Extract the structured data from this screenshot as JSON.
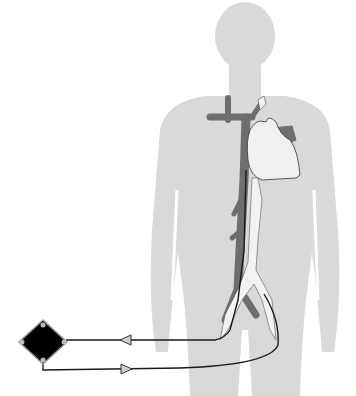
{
  "diagram": {
    "type": "medical-illustration",
    "colors": {
      "body": "#d9d9d9",
      "vein": "#6e6e6e",
      "artery": "#f2f2f2",
      "heart": "#f0f0f0",
      "cannula": "#1a1a1a",
      "device": "#000000",
      "device_border": "#9a9a9a",
      "arrow_fill": "#cfcfcf"
    },
    "elements": [
      {
        "name": "body-silhouette"
      },
      {
        "name": "heart"
      },
      {
        "name": "vena-cava"
      },
      {
        "name": "aorta"
      },
      {
        "name": "drainage-cannula"
      },
      {
        "name": "return-cannula"
      },
      {
        "name": "pump-oxygenator"
      },
      {
        "name": "flow-arrow-return"
      },
      {
        "name": "flow-arrow-drainage"
      }
    ]
  }
}
